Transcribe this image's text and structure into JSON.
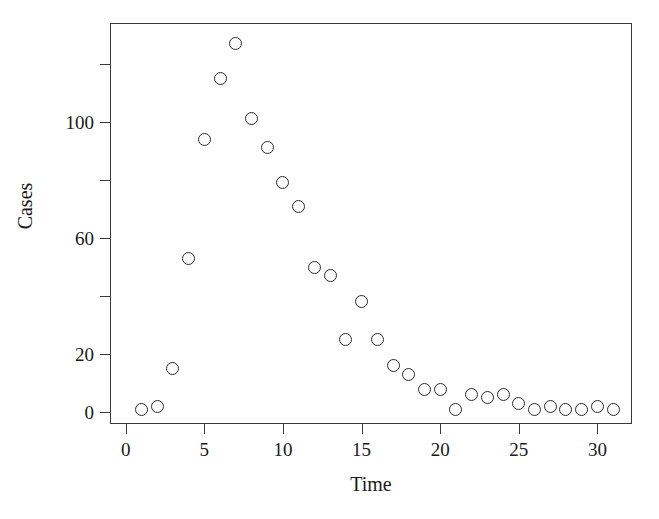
{
  "chart_data": {
    "type": "scatter",
    "title": "",
    "xlabel": "Time",
    "ylabel": "Cases",
    "xlim": [
      -1,
      32.2
    ],
    "ylim": [
      -4,
      134
    ],
    "grid": false,
    "legend": "none",
    "marker": "open-circle",
    "marker_color": "#2b2b2b",
    "xticks": [
      0,
      5,
      10,
      15,
      20,
      25,
      30
    ],
    "xticklabels": [
      "0",
      "5",
      "10",
      "15",
      "20",
      "25",
      "30"
    ],
    "yticks": [
      0,
      20,
      40,
      60,
      80,
      100,
      120
    ],
    "yticklabels": [
      "0",
      "20",
      "",
      "60",
      "",
      "100",
      ""
    ],
    "ytick_labeled": [
      0,
      20,
      60,
      100
    ],
    "x": [
      1,
      2,
      3,
      4,
      5,
      6,
      7,
      8,
      9,
      10,
      11,
      12,
      13,
      14,
      15,
      16,
      17,
      18,
      19,
      20,
      21,
      22,
      23,
      24,
      25,
      26,
      27,
      28,
      29,
      30,
      31
    ],
    "y": [
      1,
      2,
      15,
      53,
      94,
      115,
      127,
      101,
      91,
      79,
      71,
      50,
      47,
      25,
      38,
      25,
      16,
      13,
      8,
      8,
      1,
      6,
      5,
      6,
      3,
      1,
      2,
      1,
      1,
      2,
      1
    ],
    "points": [
      {
        "x": 1,
        "y": 1
      },
      {
        "x": 2,
        "y": 2
      },
      {
        "x": 3,
        "y": 15
      },
      {
        "x": 4,
        "y": 53
      },
      {
        "x": 5,
        "y": 94
      },
      {
        "x": 6,
        "y": 115
      },
      {
        "x": 7,
        "y": 127
      },
      {
        "x": 8,
        "y": 101
      },
      {
        "x": 9,
        "y": 91
      },
      {
        "x": 10,
        "y": 79
      },
      {
        "x": 11,
        "y": 71
      },
      {
        "x": 12,
        "y": 50
      },
      {
        "x": 13,
        "y": 47
      },
      {
        "x": 14,
        "y": 25
      },
      {
        "x": 15,
        "y": 38
      },
      {
        "x": 16,
        "y": 25
      },
      {
        "x": 17,
        "y": 16
      },
      {
        "x": 18,
        "y": 13
      },
      {
        "x": 19,
        "y": 8
      },
      {
        "x": 20,
        "y": 8
      },
      {
        "x": 21,
        "y": 1
      },
      {
        "x": 22,
        "y": 6
      },
      {
        "x": 23,
        "y": 5
      },
      {
        "x": 24,
        "y": 6
      },
      {
        "x": 25,
        "y": 3
      },
      {
        "x": 26,
        "y": 1
      },
      {
        "x": 27,
        "y": 2
      },
      {
        "x": 28,
        "y": 1
      },
      {
        "x": 29,
        "y": 1
      },
      {
        "x": 30,
        "y": 2
      },
      {
        "x": 31,
        "y": 1
      }
    ]
  }
}
